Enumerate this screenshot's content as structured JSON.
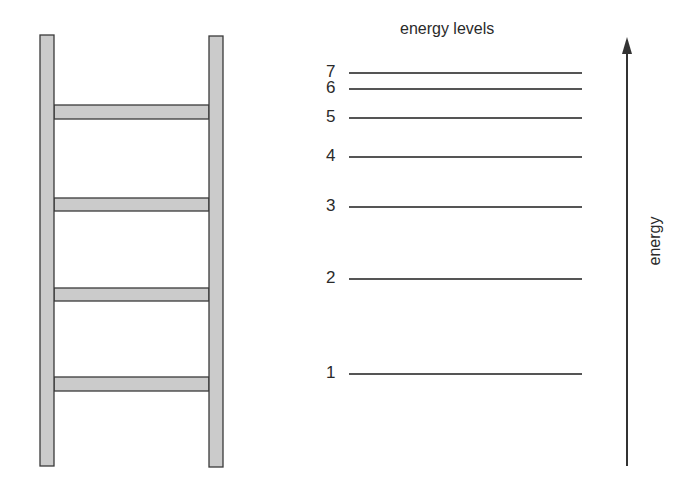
{
  "title": "energy levels",
  "axis_label": "energy",
  "colors": {
    "rail_fill": "#cbcbcb",
    "stroke": "#3a3a3a",
    "line": "#555555"
  },
  "ladder": {
    "rails": [
      {
        "name": "left",
        "x": 40,
        "y": 35,
        "w": 14,
        "h": 431
      },
      {
        "name": "right",
        "x": 209,
        "y": 36,
        "w": 14,
        "h": 431
      }
    ],
    "rungs": [
      {
        "y": 105,
        "h": 14
      },
      {
        "y": 198,
        "h": 13
      },
      {
        "y": 288,
        "h": 13
      },
      {
        "y": 377,
        "h": 14
      }
    ]
  },
  "levels": [
    {
      "n": "7",
      "y": 73
    },
    {
      "n": "6",
      "y": 89
    },
    {
      "n": "5",
      "y": 118
    },
    {
      "n": "4",
      "y": 157
    },
    {
      "n": "3",
      "y": 207
    },
    {
      "n": "2",
      "y": 279
    },
    {
      "n": "1",
      "y": 374
    }
  ],
  "arrow": {
    "x": 627,
    "y_top": 37,
    "y_bottom": 466
  }
}
